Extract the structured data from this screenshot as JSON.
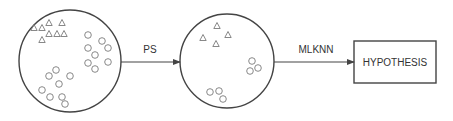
{
  "diagram": {
    "colors": {
      "line": "#444444",
      "shape": "#7a7a7a",
      "background": "#ffffff"
    },
    "nodes": [
      {
        "id": "original-dataset",
        "type": "circle",
        "cx": 70,
        "cy": 61,
        "r": 51,
        "triangles": [
          [
            34,
            28
          ],
          [
            42,
            28
          ],
          [
            49,
            23
          ],
          [
            62,
            23
          ],
          [
            49,
            34
          ],
          [
            57,
            34
          ],
          [
            64,
            34
          ],
          [
            42,
            40
          ]
        ],
        "circles": [
          [
            88,
            35
          ],
          [
            102,
            41
          ],
          [
            108,
            48
          ],
          [
            88,
            48
          ],
          [
            95,
            55
          ],
          [
            88,
            63
          ],
          [
            108,
            62
          ],
          [
            95,
            69
          ],
          [
            56,
            70
          ],
          [
            49,
            76
          ],
          [
            70,
            76
          ],
          [
            59,
            84
          ],
          [
            42,
            90
          ],
          [
            50,
            97
          ],
          [
            62,
            97
          ],
          [
            65,
            104
          ]
        ]
      },
      {
        "id": "selected-dataset",
        "type": "circle",
        "cx": 227,
        "cy": 61,
        "r": 47,
        "triangles": [
          [
            217,
            26
          ],
          [
            228,
            35
          ],
          [
            203,
            38
          ],
          [
            216,
            44
          ]
        ],
        "circles": [
          [
            252,
            61
          ],
          [
            258,
            68
          ],
          [
            250,
            71
          ],
          [
            210,
            92
          ],
          [
            219,
            91
          ],
          [
            223,
            99
          ]
        ]
      },
      {
        "id": "hypothesis",
        "type": "box",
        "label": "HYPOTHESIS",
        "x": 354,
        "y": 41,
        "width": 82,
        "height": 42
      }
    ],
    "edges": [
      {
        "from": "original-dataset",
        "to": "selected-dataset",
        "label": "PS",
        "x1": 121,
        "x2": 180,
        "y": 62
      },
      {
        "from": "selected-dataset",
        "to": "hypothesis",
        "label": "MLKNN",
        "x1": 274,
        "x2": 354,
        "y": 62
      }
    ]
  }
}
